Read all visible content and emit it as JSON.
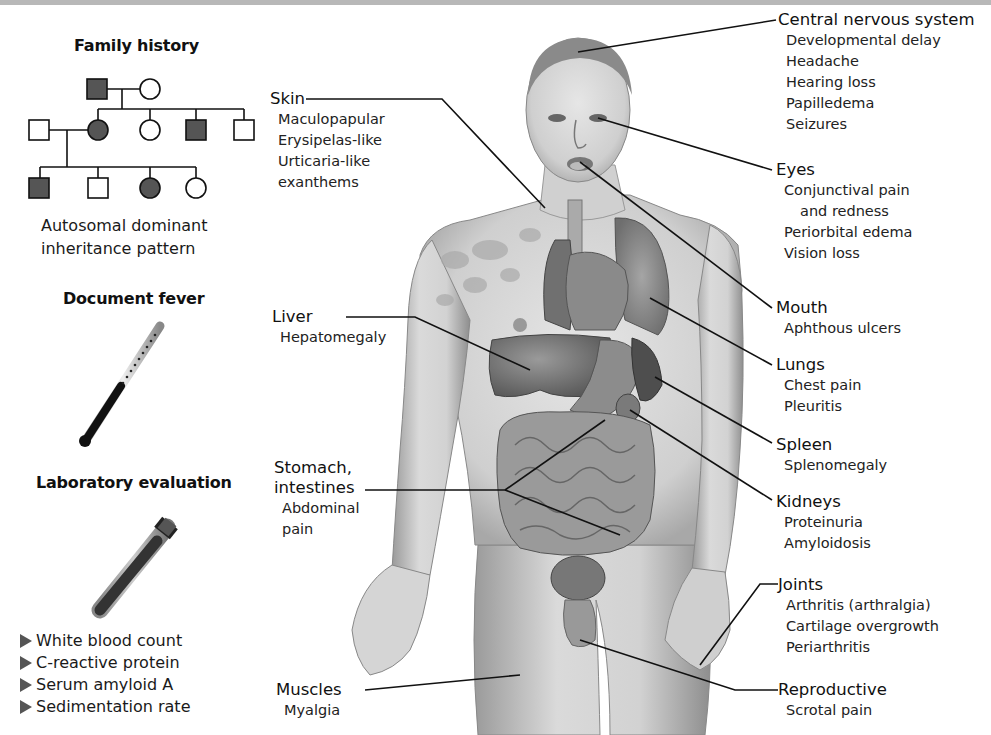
{
  "figure": {
    "type": "anatomical-diagram",
    "palette": {
      "background": "#ffffff",
      "top_band": "#b8b8b8",
      "text": "#1a1a1a",
      "pedigree_affected_fill": "#555555",
      "leader_line": "#111111"
    }
  },
  "left_panel": {
    "family_history": {
      "heading": "Family history",
      "pedigree": {
        "generation_1": [
          {
            "sex": "male",
            "affected": true
          },
          {
            "sex": "female",
            "affected": false
          }
        ],
        "generation_2": [
          {
            "sex": "male",
            "affected": false,
            "role": "spouse"
          },
          {
            "sex": "female",
            "affected": true
          },
          {
            "sex": "female",
            "affected": false
          },
          {
            "sex": "male",
            "affected": true
          },
          {
            "sex": "male",
            "affected": false
          }
        ],
        "generation_3": [
          {
            "sex": "male",
            "affected": true
          },
          {
            "sex": "male",
            "affected": false
          },
          {
            "sex": "female",
            "affected": true
          },
          {
            "sex": "female",
            "affected": false
          }
        ]
      },
      "caption_line1": "Autosomal dominant",
      "caption_line2": "inheritance pattern"
    },
    "document_fever": {
      "heading": "Document fever",
      "icon": "thermometer-icon"
    },
    "laboratory_evaluation": {
      "heading": "Laboratory evaluation",
      "icon": "test-tube-icon",
      "items": [
        "White blood count",
        "C-reactive protein",
        "Serum amyloid A",
        "Sedimentation rate"
      ]
    }
  },
  "body_labels": {
    "cns": {
      "title": "Central nervous system",
      "items": [
        "Developmental delay",
        "Headache",
        "Hearing loss",
        "Papilledema",
        "Seizures"
      ]
    },
    "eyes": {
      "title": "Eyes",
      "items": [
        "Conjunctival pain",
        "and redness",
        "Periorbital edema",
        "Vision loss"
      ]
    },
    "mouth": {
      "title": "Mouth",
      "items": [
        "Aphthous ulcers"
      ]
    },
    "lungs": {
      "title": "Lungs",
      "items": [
        "Chest pain",
        "Pleuritis"
      ]
    },
    "spleen": {
      "title": "Spleen",
      "items": [
        "Splenomegaly"
      ]
    },
    "kidneys": {
      "title": "Kidneys",
      "items": [
        "Proteinuria",
        "Amyloidosis"
      ]
    },
    "joints": {
      "title": "Joints",
      "items": [
        "Arthritis (arthralgia)",
        "Cartilage overgrowth",
        "Periarthritis"
      ]
    },
    "reproductive": {
      "title": "Reproductive",
      "items": [
        "Scrotal pain"
      ]
    },
    "skin": {
      "title": "Skin",
      "items": [
        "Maculopapular",
        "Erysipelas-like",
        "Urticaria-like",
        "exanthems"
      ]
    },
    "liver": {
      "title": "Liver",
      "items": [
        "Hepatomegaly"
      ]
    },
    "stomach": {
      "title_line1": "Stomach,",
      "title_line2": "intestines",
      "items": [
        "Abdominal",
        "pain"
      ]
    },
    "muscles": {
      "title": "Muscles",
      "items": [
        "Myalgia"
      ]
    }
  }
}
